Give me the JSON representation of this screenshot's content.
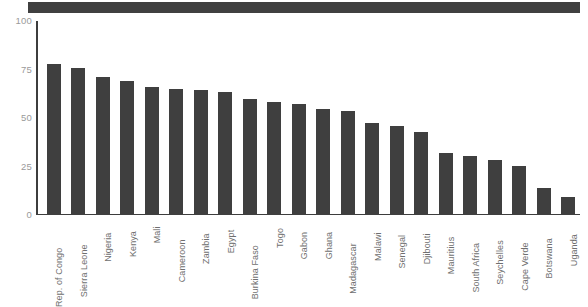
{
  "figure": {
    "background_color": "#ffffff",
    "banner_color": "#404040",
    "bar_color": "#3f3f3f",
    "axis_color": "#3d3d3d",
    "tick_label_color": "#9a9a9a",
    "category_label_color": "#6f6f6f"
  },
  "chart_data": {
    "type": "bar",
    "title": "",
    "xlabel": "",
    "ylabel": "",
    "ylim": [
      0,
      100
    ],
    "yticks": [
      "0",
      "25",
      "50",
      "75",
      "100"
    ],
    "grid": false,
    "legend": "none",
    "categories": [
      "Rep. of Congo",
      "Sierra Leone",
      "Nigeria",
      "Kenya",
      "Mali",
      "Cameroon",
      "Zambia",
      "Egypt",
      "Burkina Faso",
      "Togo",
      "Gabon",
      "Ghana",
      "Madagascar",
      "Malawi",
      "Senegal",
      "Djibouti",
      "Mauritius",
      "South Africa",
      "Seychelles",
      "Cape Verde",
      "Botswana",
      "Uganda"
    ],
    "values": [
      78,
      76,
      71,
      69,
      66,
      65,
      64.5,
      63.5,
      60,
      58.5,
      57,
      54.5,
      53.5,
      47.5,
      46,
      43,
      32,
      30.5,
      28.5,
      25.5,
      14,
      9.5
    ]
  }
}
